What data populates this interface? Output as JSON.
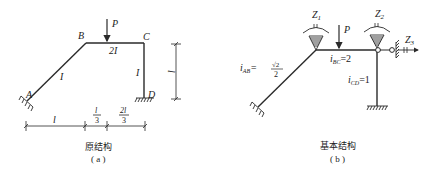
{
  "figure_a": {
    "caption": "原结构",
    "sublabel": "( a )",
    "nodes": {
      "A": "A",
      "B": "B",
      "C": "C",
      "D": "D"
    },
    "load": "P",
    "member_labels": {
      "AB": "I",
      "BC": "2I",
      "CD": "I"
    },
    "dims": {
      "vertical": "l",
      "bottom_1": "l",
      "bottom_2_num": "l",
      "bottom_2_den": "3",
      "bottom_3_num": "2l",
      "bottom_3_den": "3"
    }
  },
  "figure_b": {
    "caption": "基本结构",
    "sublabel": "( b )",
    "load": "P",
    "unknowns": {
      "z1": "Z",
      "z1_sub": "1",
      "z2": "Z",
      "z2_sub": "2",
      "z3": "Z",
      "z3_sub": "3"
    },
    "stiffness": {
      "iab_main": "i",
      "iab_sub": "AB",
      "iab_eq": "=",
      "iab_num": "√2",
      "iab_den": "2",
      "ibc_main": "i",
      "ibc_sub": "BC",
      "ibc_val": "=2",
      "icd_main": "i",
      "icd_sub": "CD",
      "icd_val": "=1"
    }
  },
  "colors": {
    "line": "#2a2a2a",
    "text": "#222222"
  }
}
